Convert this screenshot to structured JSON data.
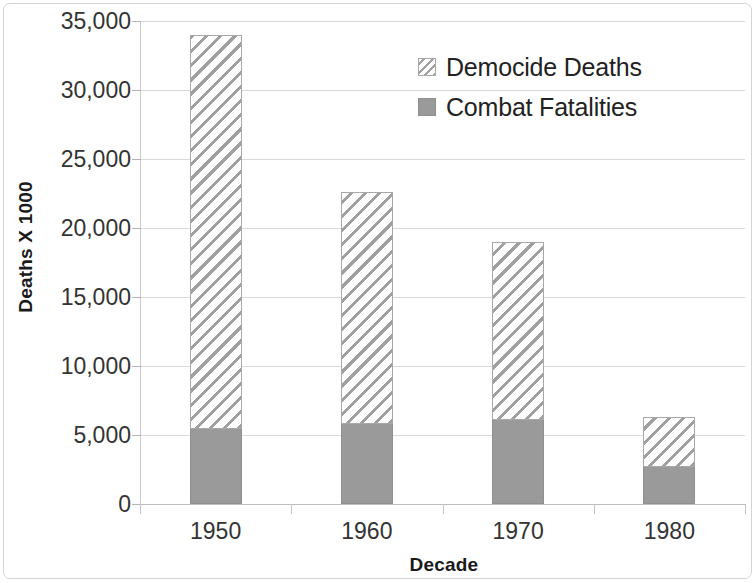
{
  "chart_data": {
    "type": "bar",
    "stacked": true,
    "title": "",
    "xlabel": "Decade",
    "ylabel": "Deaths X 1000",
    "categories": [
      "1950",
      "1960",
      "1970",
      "1980"
    ],
    "series": [
      {
        "name": "Combat Fatalities",
        "pattern": "solid-gray",
        "color": "#9a9a9a",
        "values": [
          5400,
          5800,
          6100,
          2700
        ]
      },
      {
        "name": "Democide Deaths",
        "pattern": "diagonal-hatch",
        "color": "#ffffff",
        "values": [
          28600,
          16800,
          12900,
          3600
        ]
      }
    ],
    "totals": [
      34000,
      22600,
      19000,
      6300
    ],
    "stack_order": [
      "Combat Fatalities",
      "Democide Deaths"
    ],
    "ylim": [
      0,
      35000
    ],
    "ytick_values": [
      0,
      5000,
      10000,
      15000,
      20000,
      25000,
      30000,
      35000
    ],
    "ytick_labels": [
      "0",
      "5,000",
      "10,000",
      "15,000",
      "20,000",
      "25,000",
      "30,000",
      "35,000"
    ],
    "grid": true,
    "grid_axis": "y",
    "legend_position": "top-right",
    "legend_entries": [
      "Democide Deaths",
      "Combat Fatalities"
    ]
  }
}
